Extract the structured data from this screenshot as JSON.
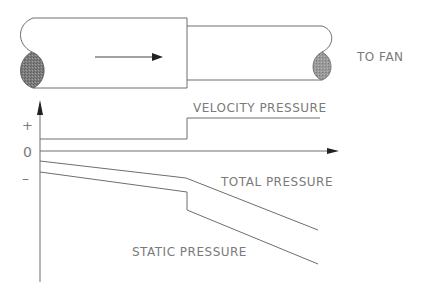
{
  "diagram": {
    "duct": {
      "flow_arrow": "right-arrow",
      "outlet_label": "TO FAN",
      "cross_section_color": "#8a8a8a"
    },
    "graph": {
      "y_axis_labels": {
        "positive": "+",
        "zero": "0",
        "negative": "–"
      },
      "curves": [
        {
          "name": "velocity",
          "label": "VELOCITY PRESSURE"
        },
        {
          "name": "total",
          "label": "TOTAL PRESSURE"
        },
        {
          "name": "static",
          "label": "STATIC PRESSURE"
        }
      ]
    },
    "colors": {
      "line": "#6e6e6e",
      "text": "#7a7a7a",
      "background": "#ffffff"
    }
  }
}
